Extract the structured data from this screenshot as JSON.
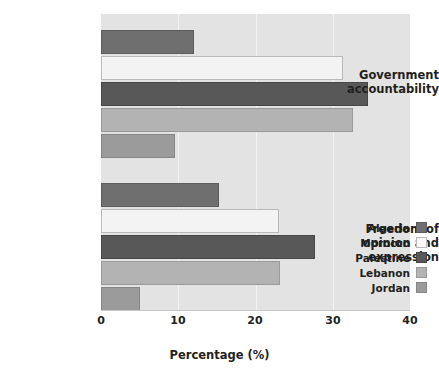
{
  "chart_data": {
    "type": "bar",
    "orientation": "horizontal",
    "title": "",
    "xlabel": "Percentage (%)",
    "ylabel": "",
    "xlim": [
      0,
      40
    ],
    "xticks": [
      0,
      10,
      20,
      30,
      40
    ],
    "xtick_labels": [
      "0",
      "10",
      "20",
      "30",
      "40"
    ],
    "grid": true,
    "grid_axis": "x",
    "legend_position": "lower right",
    "categories": [
      "Government accountability",
      "Freedom of opinion and expression"
    ],
    "category_label_lines": [
      [
        "Government",
        "accountability"
      ],
      [
        "Freedom of",
        "opinion and",
        "expression"
      ]
    ],
    "series": [
      {
        "name": "Algeria",
        "color": "#6f6f6f",
        "values": [
          12.0,
          15.3
        ]
      },
      {
        "name": "Morocco",
        "color": "#f3f3f3",
        "values": [
          31.3,
          23.0
        ]
      },
      {
        "name": "Palestine",
        "color": "#585858",
        "values": [
          34.6,
          27.7
        ]
      },
      {
        "name": "Lebanon",
        "color": "#b3b3b3",
        "values": [
          32.6,
          23.2
        ]
      },
      {
        "name": "Jordan",
        "color": "#9b9b9b",
        "values": [
          9.6,
          5.0
        ]
      }
    ]
  },
  "legend": {
    "items": [
      {
        "label": "Algeria"
      },
      {
        "label": "Morocco"
      },
      {
        "label": "Palestine"
      },
      {
        "label": "Lebanon"
      },
      {
        "label": "Jordan"
      }
    ]
  },
  "axis": {
    "x_title": "Percentage (%)",
    "tick_0": "0",
    "tick_1": "10",
    "tick_2": "20",
    "tick_3": "30",
    "tick_4": "40"
  },
  "colors": {
    "plot_background": "#e3e3e3",
    "page_background": "#ffffff",
    "gridline": "#f2f2f2",
    "text": "#231f20"
  }
}
